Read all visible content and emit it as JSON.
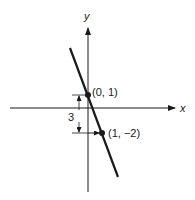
{
  "figure": {
    "type": "coordinate-plane-line",
    "x_axis_label": "x",
    "y_axis_label": "y",
    "points": [
      {
        "label": "(0, 1)",
        "x": 0,
        "y": 1
      },
      {
        "label": "(1, −2)",
        "x": 1,
        "y": -2
      }
    ],
    "rise_label": "3",
    "colors": {
      "ink": "#1a1a1a",
      "background": "#ffffff"
    }
  }
}
